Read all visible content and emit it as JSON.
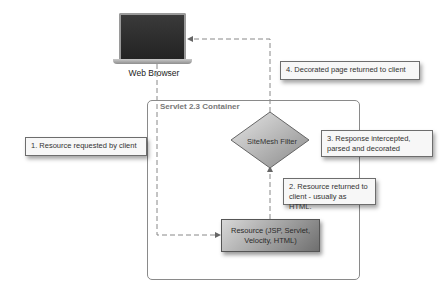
{
  "browser": {
    "label": "Web Browser",
    "icon": "laptop-icon"
  },
  "container": {
    "title": "Servlet 2.3 Container"
  },
  "filter": {
    "label": "SiteMesh Filter"
  },
  "resource": {
    "line1": "Resource (JSP, Servlet,",
    "line2": "Velocity, HTML)"
  },
  "notes": {
    "step1": "1. Resource requested by client",
    "step2_line1": "2. Resource returned to",
    "step2_line2": "client - usually as HTML.",
    "step3_line1": "3. Response intercepted,",
    "step3_line2": "parsed and decorated",
    "step4": "4. Decorated page returned to client"
  },
  "colors": {
    "line": "#888888",
    "diamond_light": "#e0e0e0",
    "diamond_dark": "#8a8a8a"
  }
}
